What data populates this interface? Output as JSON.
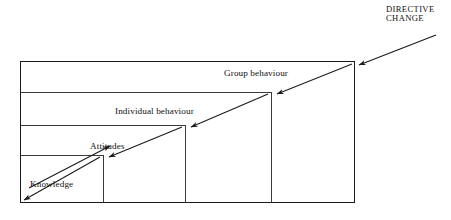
{
  "diagram": {
    "type": "nested-staircase-with-diagonal-arrows",
    "background_color": "#ffffff",
    "line_color": "#1a1a1a",
    "text_color": "#111111",
    "heading": {
      "line1": "DIRECTIVE",
      "line2": "CHANGE"
    },
    "tiers": [
      {
        "id": "group-behaviour",
        "label": "Group behaviour"
      },
      {
        "id": "individual-behaviour",
        "label": "Individual behaviour"
      },
      {
        "id": "attitudes",
        "label": "Attitudes"
      },
      {
        "id": "knowledge",
        "label": "Knowledge"
      }
    ]
  }
}
